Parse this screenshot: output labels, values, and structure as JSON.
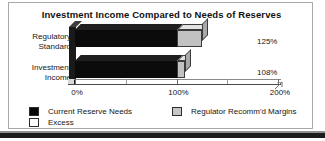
{
  "chart_data": {
    "type": "bar",
    "orientation": "horizontal",
    "style": "3d-stacked-bar",
    "title": "Investment Income Compared to Needs of Reserves",
    "xlabel": "",
    "ylabel": "",
    "categories": [
      "Regulatory Standard",
      "Investment Income"
    ],
    "category_lines": [
      [
        "Regulatory",
        "Standard"
      ],
      [
        "Investment",
        "Income"
      ]
    ],
    "series": [
      {
        "name": "Current Reserve Needs",
        "values": [
          100,
          100
        ],
        "color": "#0b0b0b"
      },
      {
        "name": "Regulator Recomm'd Margins",
        "values": [
          25,
          8
        ],
        "color": "#c2c2c2"
      }
    ],
    "totals": [
      125,
      108
    ],
    "data_labels": [
      "125%",
      "108%"
    ],
    "xlim": [
      0,
      200
    ],
    "xticks": [
      0,
      100,
      200
    ],
    "xtick_labels": [
      "0%",
      "100%",
      "200%"
    ],
    "xticks_minor": [
      50,
      150
    ],
    "grid": false,
    "legend_position": "bottom"
  },
  "legend": {
    "items": [
      {
        "label": "Current Reserve Needs",
        "swatch": "black"
      },
      {
        "label": "Excess",
        "swatch": "white"
      },
      {
        "label": "Regulator Recomm'd Margins",
        "swatch": "gray"
      }
    ]
  },
  "colors": {
    "bar_dark": "#0b0b0b",
    "bar_gray": "#c2c2c2",
    "axis": "#4a4a4a",
    "text": "#161616",
    "border": "#a9a9a9"
  }
}
